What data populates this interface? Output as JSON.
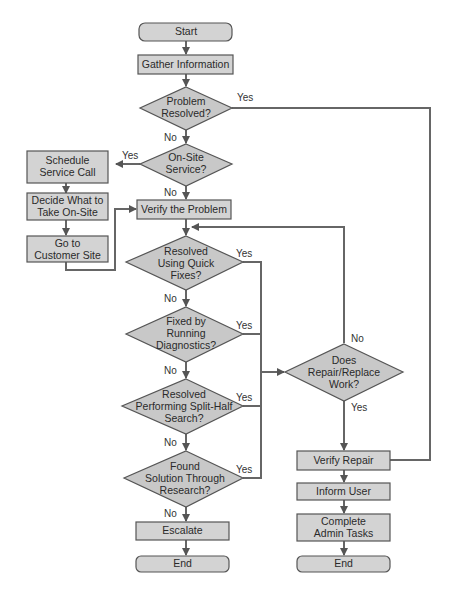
{
  "diagram": {
    "type": "flowchart",
    "nodes": {
      "start": {
        "label": "Start"
      },
      "gather": {
        "label": "Gather Information"
      },
      "problem_resolved": {
        "lines": [
          "Problem",
          "Resolved?"
        ]
      },
      "onsite": {
        "lines": [
          "On-Site",
          "Service?"
        ]
      },
      "schedule": {
        "lines": [
          "Schedule",
          "Service Call"
        ]
      },
      "decide": {
        "lines": [
          "Decide What to",
          "Take On-Site"
        ]
      },
      "goto": {
        "lines": [
          "Go to",
          "Customer Site"
        ]
      },
      "verify_problem": {
        "label": "Verify the Problem"
      },
      "quick_fixes": {
        "lines": [
          "Resolved",
          "Using Quick",
          "Fixes?"
        ]
      },
      "diagnostics": {
        "lines": [
          "Fixed by",
          "Running",
          "Diagnostics?"
        ]
      },
      "split_half": {
        "lines": [
          "Resolved",
          "Performing Split-Half",
          "Search?"
        ]
      },
      "research": {
        "lines": [
          "Found",
          "Solution Through",
          "Research?"
        ]
      },
      "escalate": {
        "label": "Escalate"
      },
      "end_left": {
        "label": "End"
      },
      "repair_work": {
        "lines": [
          "Does",
          "Repair/Replace",
          "Work?"
        ]
      },
      "verify_repair": {
        "label": "Verify Repair"
      },
      "inform_user": {
        "label": "Inform User"
      },
      "admin_tasks": {
        "lines": [
          "Complete",
          "Admin Tasks"
        ]
      },
      "end_right": {
        "label": "End"
      }
    },
    "edge_labels": {
      "yes": "Yes",
      "no": "No"
    }
  }
}
